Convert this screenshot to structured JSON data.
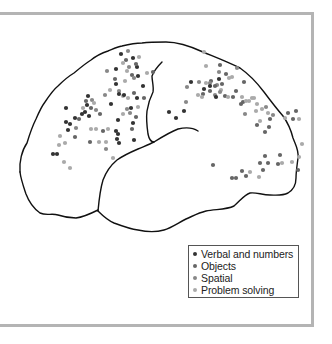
{
  "figure": {
    "type": "brain-lateral-view-activation-map",
    "legend": [
      {
        "label": "Verbal and numbers",
        "color": "#333333"
      },
      {
        "label": "Objects",
        "color": "#666666"
      },
      {
        "label": "Spatial",
        "color": "#888888"
      },
      {
        "label": "Problem solving",
        "color": "#aaaaaa"
      }
    ],
    "outline_color": "#111111",
    "frame_color": "#b4b4b4"
  },
  "dots": [
    {
      "x": 121,
      "y": 54,
      "c": 0
    },
    {
      "x": 128,
      "y": 51,
      "c": 2
    },
    {
      "x": 139,
      "y": 57,
      "c": 3
    },
    {
      "x": 126,
      "y": 60,
      "c": 1
    },
    {
      "x": 133,
      "y": 58,
      "c": 0
    },
    {
      "x": 123,
      "y": 63,
      "c": 3
    },
    {
      "x": 129,
      "y": 67,
      "c": 2
    },
    {
      "x": 137,
      "y": 67,
      "c": 0
    },
    {
      "x": 136,
      "y": 64,
      "c": 1
    },
    {
      "x": 107,
      "y": 71,
      "c": 2
    },
    {
      "x": 116,
      "y": 69,
      "c": 0
    },
    {
      "x": 127,
      "y": 71,
      "c": 3
    },
    {
      "x": 132,
      "y": 75,
      "c": 1
    },
    {
      "x": 134,
      "y": 78,
      "c": 2
    },
    {
      "x": 138,
      "y": 76,
      "c": 0
    },
    {
      "x": 147,
      "y": 73,
      "c": 3
    },
    {
      "x": 153,
      "y": 72,
      "c": 1
    },
    {
      "x": 115,
      "y": 79,
      "c": 1
    },
    {
      "x": 116,
      "y": 84,
      "c": 0
    },
    {
      "x": 125,
      "y": 81,
      "c": 3
    },
    {
      "x": 119,
      "y": 91,
      "c": 2
    },
    {
      "x": 143,
      "y": 86,
      "c": 0
    },
    {
      "x": 110,
      "y": 90,
      "c": 3
    },
    {
      "x": 134,
      "y": 93,
      "c": 1
    },
    {
      "x": 105,
      "y": 95,
      "c": 2
    },
    {
      "x": 123,
      "y": 96,
      "c": 3
    },
    {
      "x": 119,
      "y": 94,
      "c": 0
    },
    {
      "x": 124,
      "y": 95,
      "c": 0
    },
    {
      "x": 144,
      "y": 98,
      "c": 1
    },
    {
      "x": 137,
      "y": 98,
      "c": 0
    },
    {
      "x": 138,
      "y": 107,
      "c": 3
    },
    {
      "x": 127,
      "y": 109,
      "c": 2
    },
    {
      "x": 131,
      "y": 108,
      "c": 0
    },
    {
      "x": 136,
      "y": 117,
      "c": 1
    },
    {
      "x": 111,
      "y": 104,
      "c": 0
    },
    {
      "x": 123,
      "y": 114,
      "c": 3
    },
    {
      "x": 130,
      "y": 113,
      "c": 2
    },
    {
      "x": 133,
      "y": 123,
      "c": 0
    },
    {
      "x": 118,
      "y": 120,
      "c": 0
    },
    {
      "x": 132,
      "y": 129,
      "c": 1
    },
    {
      "x": 88,
      "y": 96,
      "c": 0
    },
    {
      "x": 86,
      "y": 101,
      "c": 1
    },
    {
      "x": 92,
      "y": 100,
      "c": 2
    },
    {
      "x": 94,
      "y": 103,
      "c": 3
    },
    {
      "x": 87,
      "y": 105,
      "c": 0
    },
    {
      "x": 83,
      "y": 108,
      "c": 3
    },
    {
      "x": 85,
      "y": 112,
      "c": 0
    },
    {
      "x": 91,
      "y": 108,
      "c": 1
    },
    {
      "x": 96,
      "y": 110,
      "c": 2
    },
    {
      "x": 82,
      "y": 114,
      "c": 0
    },
    {
      "x": 89,
      "y": 116,
      "c": 0
    },
    {
      "x": 100,
      "y": 114,
      "c": 1
    },
    {
      "x": 66,
      "y": 108,
      "c": 0
    },
    {
      "x": 75,
      "y": 118,
      "c": 0
    },
    {
      "x": 79,
      "y": 119,
      "c": 1
    },
    {
      "x": 66,
      "y": 122,
      "c": 0
    },
    {
      "x": 70,
      "y": 124,
      "c": 0
    },
    {
      "x": 68,
      "y": 130,
      "c": 0
    },
    {
      "x": 76,
      "y": 128,
      "c": 2
    },
    {
      "x": 91,
      "y": 129,
      "c": 3
    },
    {
      "x": 96,
      "y": 129,
      "c": 3
    },
    {
      "x": 108,
      "y": 129,
      "c": 3
    },
    {
      "x": 116,
      "y": 131,
      "c": 0
    },
    {
      "x": 118,
      "y": 134,
      "c": 0
    },
    {
      "x": 103,
      "y": 131,
      "c": 1
    },
    {
      "x": 60,
      "y": 136,
      "c": 3
    },
    {
      "x": 59,
      "y": 145,
      "c": 3
    },
    {
      "x": 65,
      "y": 143,
      "c": 3
    },
    {
      "x": 57,
      "y": 154,
      "c": 0
    },
    {
      "x": 53,
      "y": 154,
      "c": 0
    },
    {
      "x": 75,
      "y": 137,
      "c": 1
    },
    {
      "x": 90,
      "y": 142,
      "c": 1
    },
    {
      "x": 99,
      "y": 142,
      "c": 3
    },
    {
      "x": 106,
      "y": 142,
      "c": 3
    },
    {
      "x": 117,
      "y": 139,
      "c": 0
    },
    {
      "x": 119,
      "y": 143,
      "c": 0
    },
    {
      "x": 106,
      "y": 149,
      "c": 2
    },
    {
      "x": 134,
      "y": 140,
      "c": 0
    },
    {
      "x": 64,
      "y": 162,
      "c": 3
    },
    {
      "x": 70,
      "y": 168,
      "c": 3
    },
    {
      "x": 113,
      "y": 158,
      "c": 3
    },
    {
      "x": 128,
      "y": 98,
      "c": 3
    },
    {
      "x": 204,
      "y": 52,
      "c": 3
    },
    {
      "x": 206,
      "y": 66,
      "c": 3
    },
    {
      "x": 220,
      "y": 65,
      "c": 1
    },
    {
      "x": 219,
      "y": 72,
      "c": 2
    },
    {
      "x": 226,
      "y": 74,
      "c": 1
    },
    {
      "x": 229,
      "y": 78,
      "c": 3
    },
    {
      "x": 232,
      "y": 77,
      "c": 3
    },
    {
      "x": 237,
      "y": 68,
      "c": 2
    },
    {
      "x": 211,
      "y": 81,
      "c": 1
    },
    {
      "x": 210,
      "y": 83,
      "c": 2
    },
    {
      "x": 206,
      "y": 83,
      "c": 3
    },
    {
      "x": 219,
      "y": 79,
      "c": 0
    },
    {
      "x": 191,
      "y": 82,
      "c": 0
    },
    {
      "x": 199,
      "y": 82,
      "c": 2
    },
    {
      "x": 217,
      "y": 85,
      "c": 2
    },
    {
      "x": 210,
      "y": 86,
      "c": 0
    },
    {
      "x": 215,
      "y": 86,
      "c": 1
    },
    {
      "x": 187,
      "y": 87,
      "c": 2
    },
    {
      "x": 204,
      "y": 89,
      "c": 0
    },
    {
      "x": 210,
      "y": 91,
      "c": 1
    },
    {
      "x": 222,
      "y": 84,
      "c": 1
    },
    {
      "x": 221,
      "y": 90,
      "c": 3
    },
    {
      "x": 203,
      "y": 94,
      "c": 1
    },
    {
      "x": 198,
      "y": 95,
      "c": 3
    },
    {
      "x": 215,
      "y": 95,
      "c": 2
    },
    {
      "x": 220,
      "y": 92,
      "c": 2
    },
    {
      "x": 236,
      "y": 91,
      "c": 1
    },
    {
      "x": 244,
      "y": 82,
      "c": 1
    },
    {
      "x": 202,
      "y": 97,
      "c": 3
    },
    {
      "x": 216,
      "y": 97,
      "c": 0
    },
    {
      "x": 225,
      "y": 96,
      "c": 1
    },
    {
      "x": 228,
      "y": 97,
      "c": 3
    },
    {
      "x": 233,
      "y": 97,
      "c": 1
    },
    {
      "x": 186,
      "y": 102,
      "c": 2
    },
    {
      "x": 242,
      "y": 97,
      "c": 3
    },
    {
      "x": 241,
      "y": 104,
      "c": 1
    },
    {
      "x": 243,
      "y": 102,
      "c": 1
    },
    {
      "x": 252,
      "y": 98,
      "c": 3
    },
    {
      "x": 246,
      "y": 101,
      "c": 3
    },
    {
      "x": 249,
      "y": 101,
      "c": 3
    },
    {
      "x": 254,
      "y": 98,
      "c": 3
    },
    {
      "x": 257,
      "y": 104,
      "c": 3
    },
    {
      "x": 245,
      "y": 114,
      "c": 2
    },
    {
      "x": 256,
      "y": 111,
      "c": 3
    },
    {
      "x": 262,
      "y": 109,
      "c": 3
    },
    {
      "x": 266,
      "y": 107,
      "c": 2
    },
    {
      "x": 268,
      "y": 113,
      "c": 3
    },
    {
      "x": 273,
      "y": 115,
      "c": 2
    },
    {
      "x": 260,
      "y": 121,
      "c": 3
    },
    {
      "x": 270,
      "y": 119,
      "c": 1
    },
    {
      "x": 285,
      "y": 118,
      "c": 3
    },
    {
      "x": 288,
      "y": 113,
      "c": 1
    },
    {
      "x": 293,
      "y": 119,
      "c": 1
    },
    {
      "x": 299,
      "y": 119,
      "c": 3
    },
    {
      "x": 296,
      "y": 111,
      "c": 1
    },
    {
      "x": 257,
      "y": 125,
      "c": 1
    },
    {
      "x": 265,
      "y": 132,
      "c": 1
    },
    {
      "x": 269,
      "y": 127,
      "c": 1
    },
    {
      "x": 169,
      "y": 112,
      "c": 0
    },
    {
      "x": 176,
      "y": 118,
      "c": 0
    },
    {
      "x": 184,
      "y": 111,
      "c": 0
    },
    {
      "x": 302,
      "y": 144,
      "c": 3
    },
    {
      "x": 299,
      "y": 157,
      "c": 3
    },
    {
      "x": 265,
      "y": 156,
      "c": 1
    },
    {
      "x": 280,
      "y": 155,
      "c": 1
    },
    {
      "x": 268,
      "y": 163,
      "c": 1
    },
    {
      "x": 282,
      "y": 163,
      "c": 3
    },
    {
      "x": 278,
      "y": 164,
      "c": 1
    },
    {
      "x": 292,
      "y": 162,
      "c": 3
    },
    {
      "x": 242,
      "y": 171,
      "c": 1
    },
    {
      "x": 246,
      "y": 176,
      "c": 1
    },
    {
      "x": 232,
      "y": 178,
      "c": 1
    },
    {
      "x": 236,
      "y": 178,
      "c": 1
    },
    {
      "x": 259,
      "y": 177,
      "c": 3
    },
    {
      "x": 263,
      "y": 170,
      "c": 1
    },
    {
      "x": 260,
      "y": 163,
      "c": 1
    },
    {
      "x": 298,
      "y": 170,
      "c": 1
    },
    {
      "x": 213,
      "y": 165,
      "c": 1
    },
    {
      "x": 250,
      "y": 172,
      "c": 3
    }
  ]
}
